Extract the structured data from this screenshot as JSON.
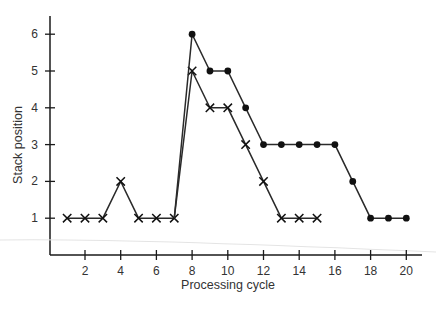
{
  "chart_data": {
    "type": "line",
    "title": "",
    "xlabel": "Processing cycle",
    "ylabel": "Stack position",
    "xlim": [
      0,
      21
    ],
    "ylim": [
      0,
      6.5
    ],
    "x_ticks": [
      2,
      4,
      6,
      8,
      10,
      12,
      14,
      16,
      18,
      20
    ],
    "y_ticks": [
      1,
      2,
      3,
      4,
      5,
      6
    ],
    "grid": false,
    "legend": null,
    "series": [
      {
        "name": "cross-marker series",
        "marker": "x",
        "x": [
          1,
          2,
          3,
          4,
          5,
          6,
          7,
          8,
          9,
          10,
          11,
          12,
          13,
          14,
          15
        ],
        "values": [
          1,
          1,
          1,
          2,
          1,
          1,
          1,
          5,
          4,
          4,
          3,
          2,
          1,
          1,
          1
        ]
      },
      {
        "name": "dot-marker series",
        "marker": "circle",
        "x": [
          7,
          8,
          9,
          10,
          11,
          12,
          13,
          14,
          15,
          16,
          17,
          18,
          19,
          20
        ],
        "values": [
          1,
          6,
          5,
          5,
          4,
          3,
          3,
          3,
          3,
          3,
          2,
          1,
          1,
          1
        ]
      }
    ]
  },
  "style": {
    "line_color": "#2a2a2a",
    "axis_color": "#1a1a1a",
    "text_color": "#333333"
  }
}
